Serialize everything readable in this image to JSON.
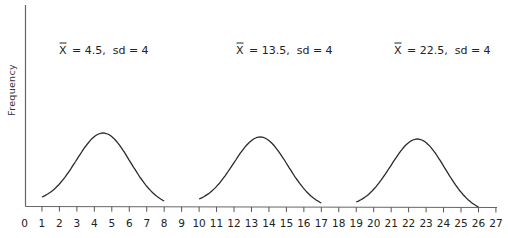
{
  "chart_data": {
    "type": "line",
    "title": "",
    "xlabel": "",
    "ylabel": "Frequency",
    "xlim": [
      0,
      27
    ],
    "x_ticks": [
      0,
      1,
      2,
      3,
      4,
      5,
      6,
      7,
      8,
      9,
      10,
      11,
      12,
      13,
      14,
      15,
      16,
      17,
      18,
      19,
      20,
      21,
      22,
      23,
      24,
      25,
      26,
      27
    ],
    "grid": false,
    "legend": null,
    "series": [
      {
        "name": "X̄ = 4.5, sd = 4",
        "mean": 4.5,
        "sd": 4,
        "x_range": [
          1,
          8
        ]
      },
      {
        "name": "X̄ = 13.5, sd = 4",
        "mean": 13.5,
        "sd": 4,
        "x_range": [
          10,
          17
        ]
      },
      {
        "name": "X̄ = 22.5, sd = 4",
        "mean": 22.5,
        "sd": 4,
        "x_range": [
          19,
          26
        ]
      }
    ],
    "annotations": [
      {
        "text_mean": "X",
        "text_rest": "= 4.5,  sd = 4",
        "x": 4.5
      },
      {
        "text_mean": "X",
        "text_rest": "= 13.5,  sd = 4",
        "x": 13.5
      },
      {
        "text_mean": "X",
        "text_rest": "= 22.5,  sd = 4",
        "x": 22.5
      }
    ]
  },
  "colors": {
    "ink": "#2a2a2a",
    "axis": "#555555",
    "background": "#ffffff"
  }
}
